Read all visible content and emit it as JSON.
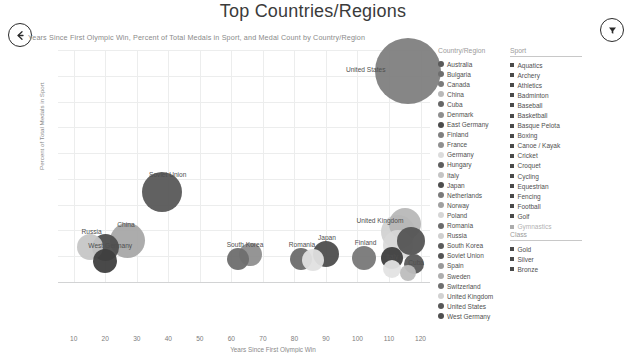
{
  "header": {
    "title": "Top Countries/Regions",
    "subtitle": "Years Since First Olympic Win, Percent of Total Medals in Sport, and Medal Count by Country/Region",
    "back_icon": "arrow-left-circle-icon",
    "filter_icon": "funnel-circle-icon"
  },
  "chart_data": {
    "type": "scatter",
    "title": "Top Countries/Regions",
    "subtitle": "Years Since First Olympic Win, Percent of Total Medals in Sport, and Medal Count by Country/Region",
    "xlabel": "Years Since First Olympic Win",
    "ylabel": "Percent of Total Medals in Sport",
    "xlim": [
      5,
      123
    ],
    "ylim": [
      0,
      18
    ],
    "xticks": [
      "10",
      "20",
      "30",
      "40",
      "50",
      "60",
      "70",
      "80",
      "90",
      "100",
      "110",
      "120"
    ],
    "xtick_values": [
      10,
      20,
      30,
      40,
      50,
      60,
      70,
      80,
      90,
      100,
      110,
      120
    ],
    "yticks": [
      "0.00 %",
      "2.00 %",
      "4.00 %",
      "6.00 %",
      "8.00 %",
      "10.00 %",
      "12.00 %",
      "14.00 %",
      "16.00 %",
      "18.00 %"
    ],
    "ytick_values": [
      0,
      2,
      4,
      6,
      8,
      10,
      12,
      14,
      16,
      18
    ],
    "grid": true,
    "legend_position": "right",
    "points": [
      {
        "label": "United States",
        "x": 116,
        "y": 16.4,
        "size": 33,
        "color": "#808080",
        "opacity": 0.95,
        "label_dx": -62,
        "label_dy": -2
      },
      {
        "label": "Soviet Union",
        "x": 38,
        "y": 7.0,
        "size": 20,
        "color": "#585858",
        "opacity": 0.95,
        "label_dx": -13,
        "label_dy": -18
      },
      {
        "label": "China",
        "x": 27,
        "y": 3.2,
        "size": 17.5,
        "color": "#a8a8a8",
        "opacity": 0.95,
        "label_dx": -10,
        "label_dy": -17
      },
      {
        "label": "Russia",
        "x": 15,
        "y": 2.7,
        "size": 13,
        "color": "#c6c6c6",
        "opacity": 0.95,
        "label_dx": -8,
        "label_dy": -16
      },
      {
        "label": "West Germany",
        "x": 20,
        "y": 2.7,
        "size": 13.5,
        "color": "#4e4e4e",
        "opacity": 0.95,
        "label_dx": -17,
        "label_dy": -2
      },
      {
        "label": "",
        "x": 20,
        "y": 1.6,
        "size": 12,
        "color": "#3f3f3f",
        "opacity": 0.95,
        "label_dx": 0,
        "label_dy": 0
      },
      {
        "label": "South Korea",
        "x": 62,
        "y": 1.8,
        "size": 11,
        "color": "#6e6e6e",
        "opacity": 0.95,
        "label_dx": -11,
        "label_dy": -15
      },
      {
        "label": "",
        "x": 66,
        "y": 2.1,
        "size": 11.5,
        "color": "#8f8f8f",
        "opacity": 0.95,
        "label_dx": 0,
        "label_dy": 0
      },
      {
        "label": "Romania",
        "x": 82,
        "y": 1.8,
        "size": 11,
        "color": "#6b6b6b",
        "opacity": 0.95,
        "label_dx": -12,
        "label_dy": -15
      },
      {
        "label": "",
        "x": 86,
        "y": 1.7,
        "size": 11,
        "color": "#e0e0e0",
        "opacity": 0.95,
        "label_dx": 0,
        "label_dy": 0
      },
      {
        "label": "Japan",
        "x": 90,
        "y": 2.2,
        "size": 13,
        "color": "#4d4d4d",
        "opacity": 0.95,
        "label_dx": -8,
        "label_dy": -17
      },
      {
        "label": "Finland",
        "x": 102,
        "y": 1.9,
        "size": 12,
        "color": "#787878",
        "opacity": 0.95,
        "label_dx": -9,
        "label_dy": -16
      },
      {
        "label": "United Kingdom",
        "x": 113,
        "y": 3.9,
        "size": 17,
        "color": "#cfcfcf",
        "opacity": 0.9,
        "label_dx": -42,
        "label_dy": -12
      },
      {
        "label": "",
        "x": 115,
        "y": 4.5,
        "size": 16,
        "color": "#b5b5b5",
        "opacity": 0.9,
        "label_dx": 0,
        "label_dy": 0
      },
      {
        "label": "",
        "x": 113,
        "y": 2.9,
        "size": 15,
        "color": "#d8d8d8",
        "opacity": 0.9,
        "label_dx": 0,
        "label_dy": 0
      },
      {
        "label": "",
        "x": 117,
        "y": 3.2,
        "size": 14,
        "color": "#545454",
        "opacity": 0.95,
        "label_dx": 0,
        "label_dy": 0
      },
      {
        "label": "Italy",
        "x": 111,
        "y": 1.9,
        "size": 11,
        "color": "#3e3e3e",
        "opacity": 0.95,
        "label_dx": -6,
        "label_dy": -2
      },
      {
        "label": "Cuba",
        "x": 118,
        "y": 1.4,
        "size": 10,
        "color": "#595959",
        "opacity": 0.95,
        "label_dx": -6,
        "label_dy": -2
      },
      {
        "label": "",
        "x": 111,
        "y": 1.0,
        "size": 9,
        "color": "#e3e3e3",
        "opacity": 0.95,
        "label_dx": 0,
        "label_dy": 0
      },
      {
        "label": "",
        "x": 116,
        "y": 0.7,
        "size": 8,
        "color": "#bdbdbd",
        "opacity": 0.95,
        "label_dx": 0,
        "label_dy": 0
      }
    ]
  },
  "country_legend": {
    "title": "Country/Region",
    "items": [
      {
        "label": "Australia",
        "color": "#5a5a5a"
      },
      {
        "label": "Bulgaria",
        "color": "#6e6e6e"
      },
      {
        "label": "Canada",
        "color": "#7b7b7b"
      },
      {
        "label": "China",
        "color": "#b9b9b9"
      },
      {
        "label": "Cuba",
        "color": "#666666"
      },
      {
        "label": "Denmark",
        "color": "#8e8e8e"
      },
      {
        "label": "East Germany",
        "color": "#4b4b4b"
      },
      {
        "label": "Finland",
        "color": "#7f7f7f"
      },
      {
        "label": "France",
        "color": "#909090"
      },
      {
        "label": "Germany",
        "color": "#dcdcdc"
      },
      {
        "label": "Hungary",
        "color": "#5e5e5e"
      },
      {
        "label": "Italy",
        "color": "#c4c4c4"
      },
      {
        "label": "Japan",
        "color": "#4d4d4d"
      },
      {
        "label": "Netherlands",
        "color": "#7a7a7a"
      },
      {
        "label": "Norway",
        "color": "#a0a0a0"
      },
      {
        "label": "Poland",
        "color": "#d6d6d6"
      },
      {
        "label": "Romania",
        "color": "#6b6b6b"
      },
      {
        "label": "Russia",
        "color": "#cfcfcf"
      },
      {
        "label": "South Korea",
        "color": "#5c5c5c"
      },
      {
        "label": "Soviet Union",
        "color": "#555555"
      },
      {
        "label": "Spain",
        "color": "#9a9a9a"
      },
      {
        "label": "Sweden",
        "color": "#aeaeae"
      },
      {
        "label": "Switzerland",
        "color": "#6f6f6f"
      },
      {
        "label": "United Kingdom",
        "color": "#d2d2d2"
      },
      {
        "label": "United States",
        "color": "#585858"
      },
      {
        "label": "West Germany",
        "color": "#4f4f4f"
      }
    ]
  },
  "sport_legend": {
    "title": "Sport",
    "items": [
      {
        "label": "Aquatics"
      },
      {
        "label": "Archery"
      },
      {
        "label": "Athletics"
      },
      {
        "label": "Badminton"
      },
      {
        "label": "Baseball"
      },
      {
        "label": "Basketball"
      },
      {
        "label": "Basque Pelota"
      },
      {
        "label": "Boxing"
      },
      {
        "label": "Canoe / Kayak"
      },
      {
        "label": "Cricket"
      },
      {
        "label": "Croquet"
      },
      {
        "label": "Cycling"
      },
      {
        "label": "Equestrian"
      },
      {
        "label": "Fencing"
      },
      {
        "label": "Football"
      },
      {
        "label": "Golf"
      },
      {
        "label": "Gymnastics"
      }
    ]
  },
  "class_legend": {
    "title": "Class",
    "items": [
      {
        "label": "Gold"
      },
      {
        "label": "Silver"
      },
      {
        "label": "Bronze"
      }
    ]
  }
}
